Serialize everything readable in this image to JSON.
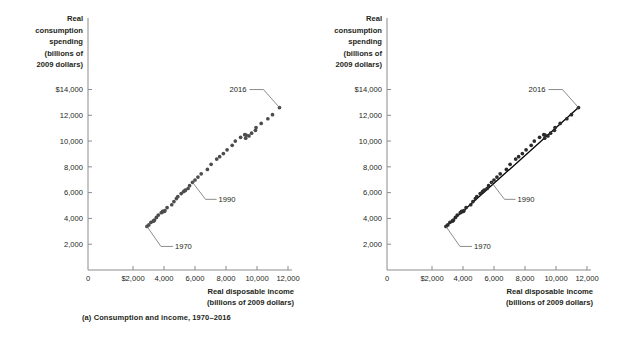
{
  "figure": {
    "background": "#ffffff",
    "text_color": "#231f20",
    "point_color": "#4d4d4d",
    "line_color": "#000000",
    "axis_color": "#8c8c8c"
  },
  "panels": [
    {
      "id": "a",
      "caption": "(a) Consumption and income, 1970–2016",
      "y_axis_title_lines": [
        "Real",
        "consumption",
        "spending",
        "(billions of",
        "2009 dollars)"
      ],
      "x_axis_title_lines": [
        "Real disposable income",
        "(billions of 2009 dollars)"
      ],
      "y_ticks": [
        "2,000",
        "4,000",
        "6,000",
        "8,000",
        "10,000",
        "12,000",
        "$14,000"
      ],
      "x_ticks": [
        "0",
        "$2,000",
        "4,000",
        "6,000",
        "8,000",
        "10,000",
        "12,000"
      ],
      "annotations": [
        {
          "label": "1970",
          "type": "leader-line"
        },
        {
          "label": "1990",
          "type": "leader-line"
        },
        {
          "label": "2016",
          "type": "leader-line"
        }
      ],
      "show_trendline": false
    },
    {
      "id": "b",
      "caption": "(b) The consumption function",
      "y_axis_title_lines": [
        "Real",
        "consumption",
        "spending",
        "(billions of",
        "2009 dollars)"
      ],
      "x_axis_title_lines": [
        "Real disposable income",
        "(billions of 2009 dollars)"
      ],
      "y_ticks": [
        "2,000",
        "4,000",
        "6,000",
        "8,000",
        "10,000",
        "12,000",
        "$14,000"
      ],
      "x_ticks": [
        "0",
        "$2,000",
        "4,000",
        "6,000",
        "8,000",
        "10,000",
        "12,000"
      ],
      "annotations": [
        {
          "label": "1970",
          "type": "leader-line"
        },
        {
          "label": "1990",
          "type": "leader-line"
        },
        {
          "label": "2016",
          "type": "leader-line"
        }
      ],
      "show_trendline": true
    }
  ],
  "chart_data": {
    "type": "scatter",
    "xlabel": "Real disposable income (billions of 2009 dollars)",
    "ylabel": "Real consumption spending (billions of 2009 dollars)",
    "xlim": [
      0,
      13000
    ],
    "ylim": [
      0,
      15000
    ],
    "x_ticks": [
      0,
      2000,
      4000,
      6000,
      8000,
      10000,
      12000
    ],
    "y_ticks": [
      2000,
      4000,
      6000,
      8000,
      10000,
      12000,
      14000
    ],
    "grid": false,
    "legend": false,
    "x_tick_labels": [
      "0",
      "$2,000",
      "4,000",
      "6,000",
      "8,000",
      "10,000",
      "12,000"
    ],
    "y_tick_labels": [
      "2,000",
      "4,000",
      "6,000",
      "8,000",
      "10,000",
      "12,000",
      "$14,000"
    ],
    "series": [
      {
        "name": "Consumption vs. disposable income, 1970-2016",
        "points": [
          {
            "year": 1970,
            "x": 2900,
            "y": 3380
          },
          {
            "year": 1971,
            "x": 3020,
            "y": 3500
          },
          {
            "year": 1972,
            "x": 3160,
            "y": 3700
          },
          {
            "year": 1973,
            "x": 3350,
            "y": 3830
          },
          {
            "year": 1974,
            "x": 3310,
            "y": 3790
          },
          {
            "year": 1975,
            "x": 3390,
            "y": 3880
          },
          {
            "year": 1976,
            "x": 3510,
            "y": 4080
          },
          {
            "year": 1977,
            "x": 3630,
            "y": 4260
          },
          {
            "year": 1978,
            "x": 3820,
            "y": 4440
          },
          {
            "year": 1979,
            "x": 3910,
            "y": 4550
          },
          {
            "year": 1980,
            "x": 3910,
            "y": 4510
          },
          {
            "year": 1981,
            "x": 4010,
            "y": 4540
          },
          {
            "year": 1982,
            "x": 4060,
            "y": 4600
          },
          {
            "year": 1983,
            "x": 4200,
            "y": 4840
          },
          {
            "year": 1984,
            "x": 4500,
            "y": 5060
          },
          {
            "year": 1985,
            "x": 4640,
            "y": 5310
          },
          {
            "year": 1986,
            "x": 4800,
            "y": 5540
          },
          {
            "year": 1987,
            "x": 4890,
            "y": 5700
          },
          {
            "year": 1988,
            "x": 5110,
            "y": 5930
          },
          {
            "year": 1989,
            "x": 5260,
            "y": 6080
          },
          {
            "year": 1990,
            "x": 5370,
            "y": 6200
          },
          {
            "year": 1991,
            "x": 5370,
            "y": 6160
          },
          {
            "year": 1992,
            "x": 5550,
            "y": 6320
          },
          {
            "year": 1993,
            "x": 5650,
            "y": 6540
          },
          {
            "year": 1994,
            "x": 5840,
            "y": 6800
          },
          {
            "year": 1995,
            "x": 6000,
            "y": 6980
          },
          {
            "year": 1996,
            "x": 6190,
            "y": 7210
          },
          {
            "year": 1997,
            "x": 6400,
            "y": 7460
          },
          {
            "year": 1998,
            "x": 6800,
            "y": 7800
          },
          {
            "year": 1999,
            "x": 7040,
            "y": 8200
          },
          {
            "year": 2000,
            "x": 7400,
            "y": 8600
          },
          {
            "year": 2001,
            "x": 7590,
            "y": 8790
          },
          {
            "year": 2002,
            "x": 7830,
            "y": 9030
          },
          {
            "year": 2003,
            "x": 8070,
            "y": 9320
          },
          {
            "year": 2004,
            "x": 8400,
            "y": 9670
          },
          {
            "year": 2005,
            "x": 8600,
            "y": 10000
          },
          {
            "year": 2006,
            "x": 8940,
            "y": 10290
          },
          {
            "year": 2007,
            "x": 9210,
            "y": 10500
          },
          {
            "year": 2008,
            "x": 9300,
            "y": 10460
          },
          {
            "year": 2009,
            "x": 9270,
            "y": 10220
          },
          {
            "year": 2010,
            "x": 9480,
            "y": 10400
          },
          {
            "year": 2011,
            "x": 9650,
            "y": 10610
          },
          {
            "year": 2012,
            "x": 9900,
            "y": 10830
          },
          {
            "year": 2013,
            "x": 9940,
            "y": 11050
          },
          {
            "year": 2014,
            "x": 10270,
            "y": 11370
          },
          {
            "year": 2015,
            "x": 10700,
            "y": 11730
          },
          {
            "year": 2016,
            "x": 11000,
            "y": 12050
          },
          {
            "year": 2017,
            "x": 11450,
            "y": 12600
          }
        ]
      }
    ],
    "trendline": {
      "x0": 2900,
      "y0": 3380,
      "x1": 11450,
      "y1": 12600,
      "panel": "b"
    },
    "annotations": [
      {
        "label": "1970",
        "point_x": 2900,
        "point_y": 3380
      },
      {
        "label": "1990",
        "point_x": 5840,
        "point_y": 6800
      },
      {
        "label": "2016",
        "point_x": 11450,
        "point_y": 12600
      }
    ]
  }
}
